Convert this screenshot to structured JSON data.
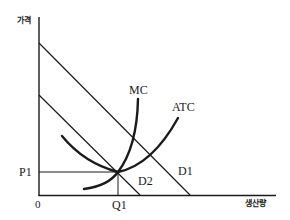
{
  "diagram": {
    "axes": {
      "y_label": "가격",
      "x_label": "생산량",
      "origin_label": "0"
    },
    "levels": {
      "price_label": "P1",
      "quantity_label": "Q1"
    },
    "curves": {
      "mc_label": "MC",
      "atc_label": "ATC",
      "d1_label": "D1",
      "d2_label": "D2"
    },
    "colors": {
      "line": "#1a1a1a",
      "background": "#ffffff"
    }
  }
}
